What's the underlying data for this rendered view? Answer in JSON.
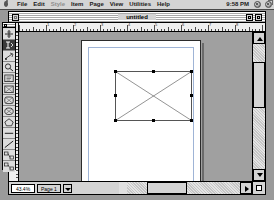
{
  "menubar": {
    "apple_icon": "apple-icon",
    "items": [
      {
        "label": "File",
        "disabled": false
      },
      {
        "label": "Edit",
        "disabled": false
      },
      {
        "label": "Style",
        "disabled": true
      },
      {
        "label": "Item",
        "disabled": false
      },
      {
        "label": "Page",
        "disabled": false
      },
      {
        "label": "View",
        "disabled": false
      },
      {
        "label": "Utilities",
        "disabled": false
      },
      {
        "label": "Help",
        "disabled": false
      }
    ],
    "clock": "9:58 PM",
    "right_icons": [
      "app-switcher-icon",
      "help-balloon-icon"
    ]
  },
  "window": {
    "title": "untitled",
    "close_box": "close-box",
    "zoom_box": "zoom-box",
    "collapse_box": "collapse-box"
  },
  "rulers": {
    "horizontal_labels": [
      "1",
      "2",
      "3",
      "4",
      "5",
      "6",
      "7",
      "8"
    ],
    "vertical_labels": [
      "1",
      "2",
      "3",
      "4",
      "5",
      "6",
      "7",
      "8",
      "9",
      "10"
    ],
    "units": "inches"
  },
  "toolbar": {
    "title": "tools-palette",
    "tools": [
      {
        "name": "item-tool",
        "selected": false
      },
      {
        "name": "content-tool",
        "selected": true
      },
      {
        "name": "rotation-tool",
        "selected": false
      },
      {
        "name": "zoom-tool",
        "selected": false
      },
      {
        "name": "text-box-tool",
        "selected": false
      },
      {
        "name": "rectangle-picture-box-tool",
        "selected": false
      },
      {
        "name": "rounded-picture-box-tool",
        "selected": false
      },
      {
        "name": "oval-picture-box-tool",
        "selected": false
      },
      {
        "name": "polygon-picture-box-tool",
        "selected": false
      },
      {
        "name": "orthogonal-line-tool",
        "selected": false
      },
      {
        "name": "line-tool",
        "selected": false
      },
      {
        "name": "linking-tool",
        "selected": false
      },
      {
        "name": "unlinking-tool",
        "selected": false
      }
    ]
  },
  "document": {
    "page_label": "page-1",
    "picture_box": {
      "name": "selected-picture-box",
      "selected": true,
      "handle_count": 8,
      "empty_cross": true
    }
  },
  "statusbar": {
    "zoom_value": "43.4%",
    "page_label": "Page 1",
    "page_nav": "page-nav-popup"
  },
  "colors": {
    "desktop": "#9a9a9a",
    "window_chrome": "#d4d4d4",
    "page": "#ffffff",
    "pasteboard": "#a0a0a0",
    "margin_guide": "#9fb4d6",
    "handle": "#000000"
  }
}
